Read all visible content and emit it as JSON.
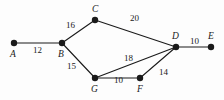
{
  "figure": {
    "kind": "weighted-undirected-graph-diagram",
    "background_color": "#fdfdfd",
    "stroke_color": "#1a1a1a",
    "node_fill_color": "#1a1a1a",
    "width": 224,
    "height": 100
  },
  "nodes": [
    {
      "id": "A",
      "label": "A",
      "cx": 14,
      "cy": 43,
      "label_x": 10,
      "label_y": 50
    },
    {
      "id": "B",
      "label": "B",
      "cx": 62,
      "cy": 43,
      "label_x": 58,
      "label_y": 50
    },
    {
      "id": "C",
      "label": "C",
      "cx": 95,
      "cy": 20,
      "label_x": 92,
      "label_y": 5
    },
    {
      "id": "D",
      "label": "D",
      "cx": 176,
      "cy": 47,
      "label_x": 172,
      "label_y": 32
    },
    {
      "id": "E",
      "label": "E",
      "cx": 211,
      "cy": 47,
      "label_x": 208,
      "label_y": 32
    },
    {
      "id": "F",
      "label": "F",
      "cx": 140,
      "cy": 78,
      "label_x": 137,
      "label_y": 85
    },
    {
      "id": "G",
      "label": "G",
      "cx": 95,
      "cy": 78,
      "label_x": 91,
      "label_y": 85
    }
  ],
  "edges": [
    {
      "from": "A",
      "to": "B",
      "weight": "12",
      "label_x": 33,
      "label_y": 46
    },
    {
      "from": "B",
      "to": "C",
      "weight": "16",
      "label_x": 66,
      "label_y": 21
    },
    {
      "from": "C",
      "to": "D",
      "weight": "20",
      "label_x": 130,
      "label_y": 14
    },
    {
      "from": "B",
      "to": "G",
      "weight": "15",
      "label_x": 67,
      "label_y": 62
    },
    {
      "from": "G",
      "to": "D",
      "weight": "18",
      "label_x": 124,
      "label_y": 54
    },
    {
      "from": "G",
      "to": "F",
      "weight": "10",
      "label_x": 114,
      "label_y": 76
    },
    {
      "from": "F",
      "to": "D",
      "weight": "14",
      "label_x": 159,
      "label_y": 68
    },
    {
      "from": "D",
      "to": "E",
      "weight": "10",
      "label_x": 190,
      "label_y": 37
    }
  ]
}
